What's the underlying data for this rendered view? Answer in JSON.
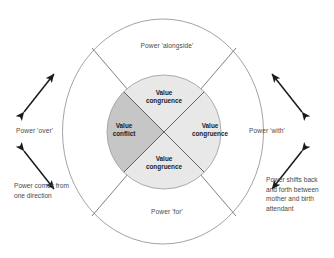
{
  "diagram": {
    "colors": {
      "conflict_fill": "#c6c6c6",
      "congruence_fill": "#e8e8e8",
      "outline": "#8c8c8c",
      "divider": "#4a4a4a",
      "arrow": "#1a1a1a",
      "text": "#4a4a4a",
      "quadrant_text": "#1d1d1d",
      "background": "#ffffff"
    },
    "ring_labels": {
      "top": "Power 'alongside'",
      "left": "Power 'over'",
      "right": "Power 'with'",
      "bottom": "Power 'for'"
    },
    "quadrants": [
      {
        "position": "top",
        "label": "Value congruence",
        "line1": "Value",
        "line2": "congruence",
        "fill": "#e8e8e8"
      },
      {
        "position": "left",
        "label": "Value conflict",
        "line1": "Value",
        "line2": "conflict",
        "fill": "#c6c6c6"
      },
      {
        "position": "right",
        "label": "Value congruence",
        "line1": "Value",
        "line2": "congruence",
        "fill": "#e8e8e8"
      },
      {
        "position": "bottom",
        "label": "Value congruence",
        "line1": "Value",
        "line2": "congruence",
        "fill": "#e8e8e8"
      }
    ],
    "notes": {
      "left": "Power comes from one direction",
      "right": "Power shifts back and forth between mother and birth attendant"
    },
    "arrows": [
      {
        "name": "left-upper-arrow",
        "side": "left",
        "direction": "double",
        "orientation": "ne-sw"
      },
      {
        "name": "left-lower-arrow",
        "side": "left",
        "direction": "double",
        "orientation": "nw-se"
      },
      {
        "name": "right-upper-arrow",
        "side": "right",
        "direction": "double",
        "orientation": "nw-se"
      },
      {
        "name": "right-lower-arrow",
        "side": "right",
        "direction": "double",
        "orientation": "ne-sw"
      }
    ]
  }
}
